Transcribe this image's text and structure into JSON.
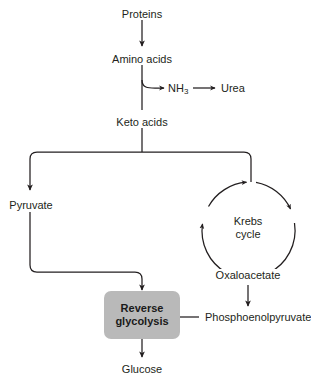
{
  "diagram": {
    "nodes": {
      "proteins": "Proteins",
      "amino_acids": "Amino acids",
      "ammonia": "NH",
      "ammonia_sub": "3",
      "urea": "Urea",
      "keto_acids": "Keto acids",
      "pyruvate": "Pyruvate",
      "krebs_line1": "Krebs",
      "krebs_line2": "cycle",
      "oxaloacetate": "Oxaloacetate",
      "phosphoenolpyruvate": "Phosphoenolpyruvate",
      "reverse_glycolysis_line1": "Reverse",
      "reverse_glycolysis_line2": "glycolysis",
      "glucose": "Glucose"
    },
    "colors": {
      "stroke": "#231f20",
      "text": "#231f20",
      "box_fill": "#b9b9b9",
      "background": "#ffffff"
    }
  }
}
